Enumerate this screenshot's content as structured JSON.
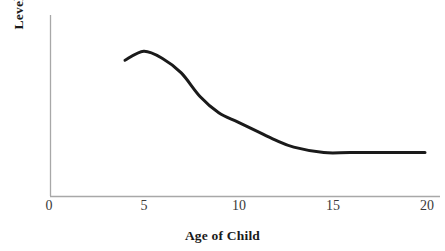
{
  "chart_data": {
    "type": "line",
    "title": "",
    "xlabel": "Age of Child",
    "ylabel": "Level of Hope",
    "xlim": [
      0,
      20
    ],
    "ylim": [
      0,
      100
    ],
    "grid": false,
    "legend": null,
    "x_ticks": [
      "0",
      "5",
      "10",
      "15",
      "20"
    ],
    "x_tick_values": [
      0,
      5,
      10,
      15,
      20
    ],
    "y_ticks": [],
    "series": [
      {
        "name": "Level of Hope",
        "color": "#1a1a1a",
        "line_width": 3,
        "x": [
          4,
          5,
          6,
          7,
          8,
          9,
          10,
          11,
          12,
          13,
          14.6,
          16,
          18,
          20
        ],
        "values": [
          75,
          80,
          76,
          68,
          55,
          46,
          41,
          36,
          31,
          27,
          24,
          24,
          24,
          24
        ]
      }
    ],
    "axis_color": "#a8a8a8",
    "background": "#ffffff"
  },
  "axes": {
    "x_axis_label": "Age of Child",
    "y_axis_label": "Level of Hope"
  }
}
